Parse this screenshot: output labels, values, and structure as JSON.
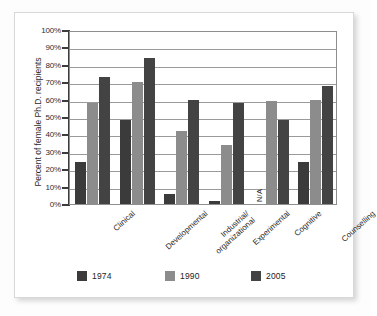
{
  "chart_data": {
    "type": "bar",
    "title": "",
    "xlabel": "",
    "ylabel": "Percent of female Ph.D. recipients",
    "ylim": [
      0,
      100
    ],
    "ytick_labels": [
      "100%",
      "90%",
      "80%",
      "70%",
      "60%",
      "50%",
      "40%",
      "30%",
      "20%",
      "10%",
      "0%"
    ],
    "ytick_values": [
      100,
      90,
      80,
      70,
      60,
      50,
      40,
      30,
      20,
      10,
      0
    ],
    "grid": true,
    "legend_position": "bottom",
    "categories": [
      "Clinical",
      "Developmental",
      "Industrial/\norganizational",
      "Experimental",
      "Cognitive",
      "Counselling"
    ],
    "series": [
      {
        "name": "1974",
        "color": "#3b3b3b",
        "values": [
          24,
          48,
          6,
          2,
          null,
          24
        ]
      },
      {
        "name": "1990",
        "color": "#8c8c8c",
        "values": [
          58,
          70,
          42,
          34,
          59,
          60
        ]
      },
      {
        "name": "2005",
        "color": "#434343",
        "values": [
          73,
          84,
          60,
          58,
          48,
          68
        ]
      }
    ],
    "annotations": [
      {
        "text": "N/A",
        "category": "Cognitive",
        "series": "1974",
        "rotated": true
      }
    ]
  },
  "axis": {
    "y_label": "Percent of female Ph.D. recipients",
    "ticks": [
      {
        "label": "100%"
      },
      {
        "label": "90%"
      },
      {
        "label": "80%"
      },
      {
        "label": "70%"
      },
      {
        "label": "60%"
      },
      {
        "label": "50%"
      },
      {
        "label": "40%"
      },
      {
        "label": "30%"
      },
      {
        "label": "20%"
      },
      {
        "label": "10%"
      },
      {
        "label": "0%"
      }
    ]
  },
  "categories": [
    {
      "label": "Clinical"
    },
    {
      "label": "Developmental"
    },
    {
      "label": "Industrial/",
      "label2": "organizational"
    },
    {
      "label": "Experimental"
    },
    {
      "label": "Cognitive"
    },
    {
      "label": "Counselling"
    }
  ],
  "legend": [
    {
      "label": "1974",
      "color": "#3b3b3b"
    },
    {
      "label": "1990",
      "color": "#8c8c8c"
    },
    {
      "label": "2005",
      "color": "#434343"
    }
  ],
  "annotations": {
    "na": "N/A"
  }
}
